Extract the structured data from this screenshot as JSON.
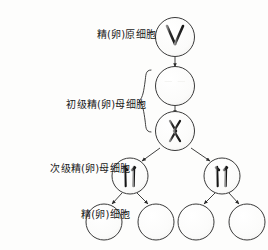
{
  "figure": {
    "type": "biology-diagram",
    "topic": "meiosis",
    "background_color": "#fdfdfc",
    "ink_color": "#1a1a1a"
  },
  "labels": {
    "oogonium": "精(卵)原细胞",
    "primary_spermatocyte": "初级精(卵)母细胞",
    "secondary_spermatocyte": "次级精(卵)母细胞",
    "gamete": "精(卵)细胞"
  },
  "stages": [
    {
      "key": "oogonium",
      "label": "精(卵)原细胞",
      "cells": 1,
      "chromosome_count": 2,
      "chromosome_style": "v-shape"
    },
    {
      "key": "primary_replicated",
      "label": "初级精(卵)母细胞",
      "cells": 1,
      "chromosome_count": 4,
      "chromosome_style": "four-bars"
    },
    {
      "key": "primary_paired",
      "label": "初级精(卵)母细胞",
      "cells": 1,
      "chromosome_count": 4,
      "chromosome_style": "tetrad-crossed"
    },
    {
      "key": "secondary_spermatocyte",
      "label": "次级精(卵)母细胞",
      "cells": 2,
      "chromosome_count": 2,
      "chromosome_style": "two-bars"
    },
    {
      "key": "gamete",
      "label": "精(卵)细胞",
      "cells": 4,
      "chromosome_count": 1,
      "chromosome_style": "single-bar"
    }
  ],
  "brace": {
    "name": "primary-spermatocyte-brace",
    "spans_stages": [
      "primary_replicated",
      "primary_paired"
    ]
  },
  "arrows": [
    {
      "from": "oogonium",
      "to": "primary_replicated",
      "kind": "vertical"
    },
    {
      "from": "primary_replicated",
      "to": "primary_paired",
      "kind": "vertical"
    },
    {
      "from": "primary_paired",
      "to": "secondary_left",
      "kind": "diagonal"
    },
    {
      "from": "primary_paired",
      "to": "secondary_right",
      "kind": "diagonal"
    },
    {
      "from": "secondary_left",
      "to": "gamete_1",
      "kind": "diagonal"
    },
    {
      "from": "secondary_left",
      "to": "gamete_2",
      "kind": "diagonal"
    },
    {
      "from": "secondary_right",
      "to": "gamete_3",
      "kind": "diagonal"
    },
    {
      "from": "secondary_right",
      "to": "gamete_4",
      "kind": "diagonal"
    }
  ]
}
